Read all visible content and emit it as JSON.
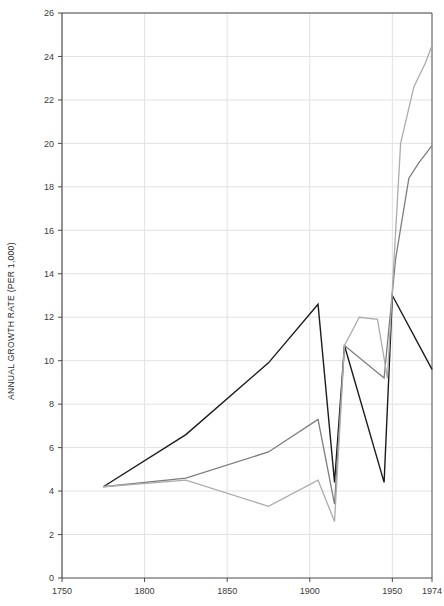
{
  "chart_data": {
    "type": "line",
    "title": "",
    "xlabel": "",
    "ylabel": "ANNUAL GROWTH RATE (PER 1,000)",
    "xlim": [
      1750,
      1974
    ],
    "ylim": [
      0,
      26
    ],
    "grid": true,
    "legend": "none",
    "xticks": [
      1750,
      1800,
      1850,
      1900,
      1950,
      1974
    ],
    "xtick_labels": [
      "1750",
      "1800",
      "1850",
      "1900",
      "1950",
      "1974"
    ],
    "yticks": [
      0,
      2,
      4,
      6,
      8,
      10,
      12,
      14,
      16,
      18,
      20,
      22,
      24,
      26
    ],
    "ytick_labels": [
      "0",
      "2",
      "4",
      "6",
      "8",
      "10",
      "12",
      "14",
      "16",
      "18",
      "20",
      "22",
      "24",
      "26"
    ],
    "series": [
      {
        "name": "series-dark",
        "color": "#1c1c1c",
        "width": 1.4,
        "points": [
          [
            1775,
            4.2
          ],
          [
            1825,
            6.6
          ],
          [
            1875,
            9.9
          ],
          [
            1905,
            12.6
          ],
          [
            1915,
            4.4
          ],
          [
            1921,
            10.7
          ],
          [
            1945,
            4.4
          ],
          [
            1950,
            13.0
          ],
          [
            1974,
            9.6
          ]
        ]
      },
      {
        "name": "series-medium",
        "color": "#7d7d7d",
        "width": 1.3,
        "points": [
          [
            1775,
            4.2
          ],
          [
            1825,
            4.6
          ],
          [
            1875,
            5.8
          ],
          [
            1905,
            7.3
          ],
          [
            1915,
            3.4
          ],
          [
            1921,
            10.7
          ],
          [
            1945,
            9.2
          ],
          [
            1952,
            14.7
          ],
          [
            1960,
            18.4
          ],
          [
            1966,
            19.1
          ],
          [
            1974,
            19.9
          ]
        ]
      },
      {
        "name": "series-light",
        "color": "#acacac",
        "width": 1.3,
        "points": [
          [
            1775,
            4.2
          ],
          [
            1825,
            4.5
          ],
          [
            1875,
            3.3
          ],
          [
            1905,
            4.5
          ],
          [
            1915,
            2.6
          ],
          [
            1921,
            10.7
          ],
          [
            1930,
            12.0
          ],
          [
            1941,
            11.9
          ],
          [
            1947,
            9.2
          ],
          [
            1955,
            20.0
          ],
          [
            1963,
            22.6
          ],
          [
            1970,
            23.7
          ],
          [
            1974,
            24.5
          ]
        ]
      }
    ]
  },
  "plot": {
    "background": "#ffffff",
    "grid_color": "#e2e2e2",
    "axis_color": "#4a4a4a"
  }
}
